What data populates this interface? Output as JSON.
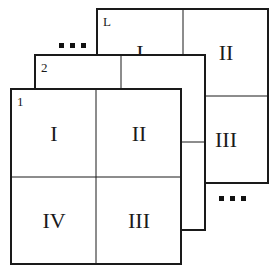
{
  "diagram": {
    "type": "stacked-layers",
    "layers": [
      {
        "id": "L",
        "quadrants": {
          "top_left": "I",
          "top_right": "II",
          "bottom_right": "III",
          "bottom_left": "IV"
        }
      },
      {
        "id": "2",
        "quadrants": {
          "top_left": "I",
          "top_right": "II",
          "bottom_right": "III",
          "bottom_left": "IV"
        }
      },
      {
        "id": "1",
        "quadrants": {
          "top_left": "I",
          "top_right": "II",
          "bottom_right": "III",
          "bottom_left": "IV"
        }
      }
    ],
    "ellipsis_top": "...",
    "ellipsis_bottom": "..."
  },
  "colors": {
    "line": "#1a1a1a",
    "background": "#ffffff"
  }
}
